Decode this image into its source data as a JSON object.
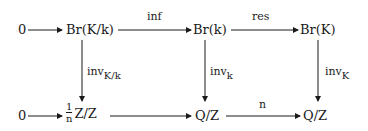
{
  "diagram": {
    "type": "commutative-diagram",
    "top_row": {
      "zero": "0",
      "node1": "Br(K/k)",
      "node2": "Br(k)",
      "node3": "Br(K)"
    },
    "bottom_row": {
      "zero": "0",
      "node1_frac_num": "1",
      "node1_frac_den": "n",
      "node1_rest": "Z/Z",
      "node2": "Q/Z",
      "node3": "Q/Z"
    },
    "horizontal_labels": {
      "top_1_2": "inf",
      "top_2_3": "res",
      "bottom_2_3": "n"
    },
    "vertical_labels": {
      "left": {
        "base": "inv",
        "sub": "K/k"
      },
      "middle": {
        "base": "inv",
        "sub": "k"
      },
      "right": {
        "base": "inv",
        "sub": "K"
      }
    }
  }
}
